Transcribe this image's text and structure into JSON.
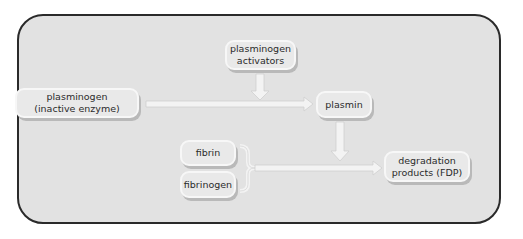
{
  "diagram": {
    "nodes": {
      "activators": "plasminogen\nactivators",
      "plasminogen": "plasminogen\n(inactive enzyme)",
      "plasmin": "plasmin",
      "fibrin": "fibrin",
      "fibrinogen": "fibrinogen",
      "fdp": "degradation\nproducts (FDP)"
    },
    "edges": [
      {
        "from": "plasminogen",
        "to": "plasmin"
      },
      {
        "from": "activators",
        "to": "plasminogen->plasmin arrow"
      },
      {
        "from": "plasmin",
        "to": "fibrin/fibrinogen->FDP arrow"
      },
      {
        "from": "fibrin + fibrinogen",
        "to": "fdp"
      }
    ],
    "colors": {
      "panel": "#e2e2e2",
      "panel_border": "#2a2a2a",
      "box_fill": "#e9e9e9",
      "box_border": "#f7f7f7",
      "arrow_fill": "#f2f2f2",
      "arrow_stroke": "#d0d0d0"
    }
  }
}
